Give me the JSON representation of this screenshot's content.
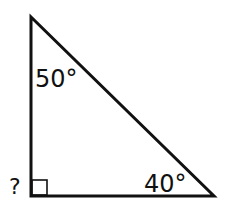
{
  "diagram": {
    "type": "right-triangle",
    "vertices": {
      "top": [
        31,
        17
      ],
      "right_angle": [
        31,
        196
      ],
      "bottom_right": [
        214,
        196
      ]
    },
    "angles": [
      {
        "vertex": "top",
        "label": "50°",
        "value": 50
      },
      {
        "vertex": "bottom_right",
        "label": "40°",
        "value": 40
      },
      {
        "vertex": "right_angle",
        "label": "?",
        "value": null,
        "marker": "right-angle-square"
      }
    ],
    "stroke_color": "#111111",
    "background": "#ffffff"
  }
}
